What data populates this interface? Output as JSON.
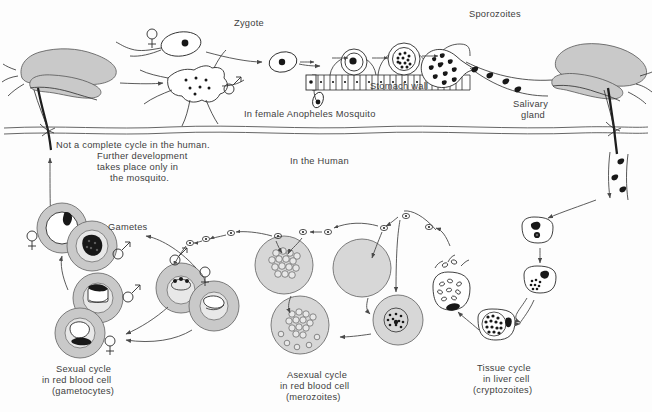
{
  "figure": {
    "width": 652,
    "height": 412,
    "background_color": "#fdfdfd",
    "ink_color": "#2b2b2b",
    "gray_fill_color": "#c9c9c9",
    "light_gray_fill_color": "#e8e8e8"
  },
  "labels": {
    "zygote": "Zygote",
    "sporozoites": "Sporozoites",
    "stomach_wall": "Stomach wall",
    "in_female_prefix": "In  female ",
    "anopheles": "Anopheles",
    "in_female_suffix": " Mosquito",
    "salivary_gland_line1": "Salivary",
    "salivary_gland_line2": "gland",
    "in_the_human": "In the Human",
    "note_line1": "Not a complete cycle in the human.",
    "note_line2": "Further development",
    "note_line3": "takes place only in",
    "note_line4": "the mosquito.",
    "gametes": "Gametes",
    "sexual_cycle_line1": "Sexual cycle",
    "sexual_cycle_line2": "in red blood cell",
    "sexual_cycle_line3": "(gametocytes)",
    "asexual_cycle_line1": "Asexual cycle",
    "asexual_cycle_line2": "in red blood cell",
    "asexual_cycle_line3": "(merozoites)",
    "tissue_cycle_line1": "Tissue cycle",
    "tissue_cycle_line2": "in liver cell",
    "tissue_cycle_line3": "(cryptozoites)"
  },
  "symbols": {
    "female": "female-venus-symbol",
    "male": "male-mars-symbol"
  },
  "regions": {
    "mosquito_section": "In female Anopheles Mosquito",
    "human_section": "In the Human"
  }
}
